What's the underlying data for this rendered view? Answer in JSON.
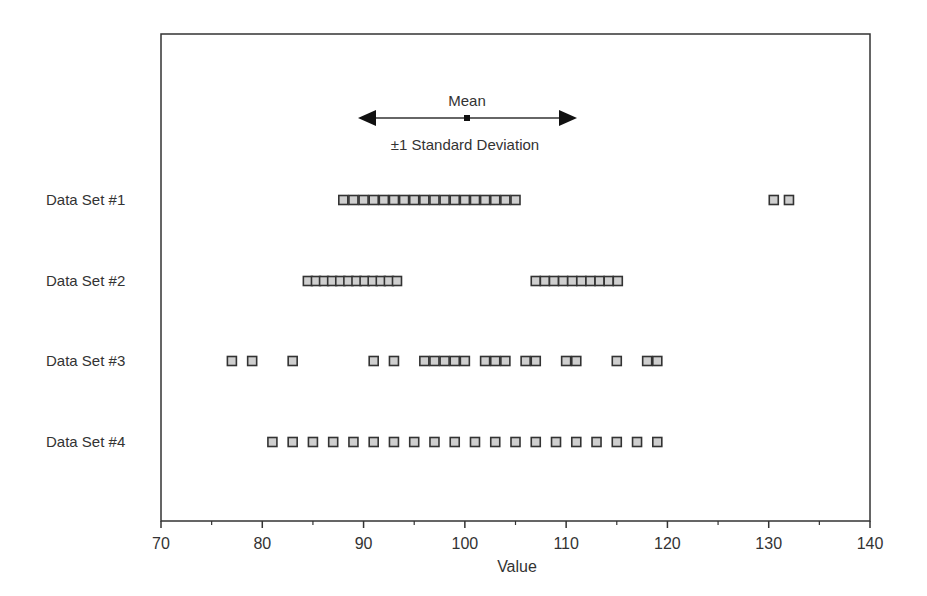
{
  "chart_data": {
    "type": "scatter",
    "title": "",
    "xlabel": "Value",
    "ylabel": "",
    "xlim": [
      70,
      140
    ],
    "x_ticks": [
      70,
      80,
      90,
      100,
      110,
      120,
      130,
      140
    ],
    "x_minor_ticks": [
      75,
      85,
      95,
      105,
      115,
      125,
      135
    ],
    "grid": false,
    "legend": {
      "mean_label": "Mean",
      "sd_label": "±1 Standard Deviation",
      "mean_value": 100,
      "sd_range": [
        90,
        110
      ]
    },
    "series": [
      {
        "name": "Data Set #1",
        "values": [
          88,
          89,
          90,
          91,
          92,
          93,
          94,
          95,
          96,
          97,
          98,
          99,
          100,
          101,
          102,
          103,
          104,
          105,
          130.5,
          132
        ]
      },
      {
        "name": "Data Set #2",
        "values": [
          84.5,
          85.3,
          86.1,
          86.9,
          87.7,
          88.5,
          89.3,
          90.1,
          90.9,
          91.7,
          92.5,
          93.3,
          107,
          107.9,
          108.8,
          109.7,
          110.6,
          111.5,
          112.4,
          113.3,
          114.2,
          115.1
        ]
      },
      {
        "name": "Data Set #3",
        "values": [
          77,
          79,
          83,
          91,
          93,
          96,
          97,
          98,
          99,
          100,
          102,
          103,
          104,
          106,
          107,
          110,
          111,
          115,
          118,
          119
        ]
      },
      {
        "name": "Data Set #4",
        "values": [
          81,
          83,
          85,
          87,
          89,
          91,
          93,
          95,
          97,
          99,
          101,
          103,
          105,
          107,
          109,
          111,
          113,
          115,
          117,
          119
        ]
      }
    ]
  }
}
